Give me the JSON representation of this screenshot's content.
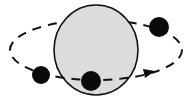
{
  "diagram": {
    "type": "orbit",
    "colors": {
      "background": "#ffffff",
      "central_body_fill": "#dcdcdc",
      "stroke": "#111111",
      "orbiting_body": "#0a0a0a"
    },
    "central_body": {
      "cx": 96,
      "cy": 50,
      "rx": 42,
      "ry": 45
    },
    "orbit": {
      "cx": 96,
      "cy": 50,
      "rx": 86,
      "ry": 30,
      "style": "dashed"
    },
    "orbiting_bodies": [
      {
        "name": "top-right",
        "cx": 159,
        "cy": 27,
        "r": 10
      },
      {
        "name": "bottom-center",
        "cx": 91,
        "cy": 81,
        "r": 10
      },
      {
        "name": "left",
        "cx": 41,
        "cy": 75,
        "r": 9
      }
    ],
    "direction_arrow": {
      "x": 150,
      "y": 73,
      "direction": "right"
    }
  }
}
